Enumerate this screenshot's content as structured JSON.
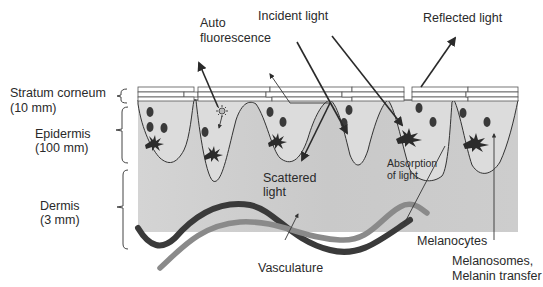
{
  "diagram": {
    "layers": [
      {
        "name": "Stratum corneum",
        "thickness": "(10 mm)"
      },
      {
        "name": "Epidermis",
        "thickness": "(100 mm)"
      },
      {
        "name": "Dermis",
        "thickness": "(3 mm)"
      }
    ],
    "annotations": {
      "auto_fluorescence_line1": "Auto",
      "auto_fluorescence_line2": "fluorescence",
      "incident_light": "Incident light",
      "reflected_light": "Reflected light",
      "scattered_light_line1": "Scattered",
      "scattered_light_line2": "light",
      "absorption_line1": "Absorption",
      "absorption_line2": "of light",
      "melanocytes": "Melanocytes",
      "melanosomes_line1": "Melanosomes,",
      "melanosomes_line2": "Melanin transfer",
      "vasculature": "Vasculature"
    },
    "colors": {
      "dermis_fill": "#cfcfcf",
      "epidermis_fill": "#e2e2e2",
      "vessel_dark": "#3a3a3a",
      "vessel_light": "#8a8a8a",
      "text": "#2a2a2a"
    }
  }
}
